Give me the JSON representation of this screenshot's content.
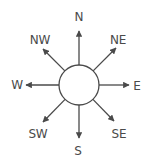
{
  "diagram": {
    "type": "compass-rose",
    "center": {
      "x": 79,
      "y": 85
    },
    "radius": 20,
    "colors": {
      "line": "#4a4a4a",
      "text": "#4a4a4a",
      "circle_fill": "#ffffff"
    },
    "directions": [
      {
        "id": "n",
        "label": "N",
        "label_x": 79,
        "label_y": 17,
        "tip_x": 79,
        "tip_y": 31
      },
      {
        "id": "ne",
        "label": "NE",
        "label_x": 118,
        "label_y": 40,
        "tip_x": 116,
        "tip_y": 48
      },
      {
        "id": "e",
        "label": "E",
        "label_x": 137,
        "label_y": 86,
        "tip_x": 129,
        "tip_y": 85
      },
      {
        "id": "se",
        "label": "SE",
        "label_x": 119,
        "label_y": 134,
        "tip_x": 114,
        "tip_y": 121
      },
      {
        "id": "s",
        "label": "S",
        "label_x": 78,
        "label_y": 151,
        "tip_x": 79,
        "tip_y": 138
      },
      {
        "id": "sw",
        "label": "SW",
        "label_x": 38,
        "label_y": 134,
        "tip_x": 43,
        "tip_y": 122
      },
      {
        "id": "w",
        "label": "W",
        "label_x": 17,
        "label_y": 85,
        "tip_x": 26,
        "tip_y": 85
      },
      {
        "id": "nw",
        "label": "NW",
        "label_x": 40,
        "label_y": 40,
        "tip_x": 43,
        "tip_y": 49
      }
    ]
  }
}
